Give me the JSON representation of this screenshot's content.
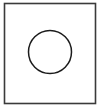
{
  "figure": {
    "canvas": {
      "width": 100,
      "height": 108,
      "background_color": "#ffffff"
    },
    "shapes": [
      {
        "name": "square-outline",
        "type": "rectangle",
        "x": 4.5,
        "y": 3.5,
        "width": 91,
        "height": 100,
        "stroke_color": "#3a3a3a",
        "stroke_width": 1.6,
        "fill": "none"
      },
      {
        "name": "circle-outline",
        "type": "circle",
        "center_x": 50,
        "center_y": 52,
        "radius": 21.5,
        "stroke_color": "#1c1c1c",
        "stroke_width": 1.5,
        "fill": "none"
      }
    ]
  }
}
